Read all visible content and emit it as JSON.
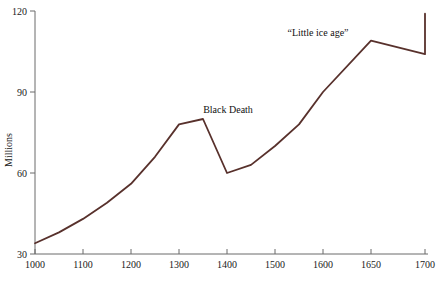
{
  "chart_data": {
    "type": "line",
    "title": "",
    "xlabel": "",
    "ylabel": "Millions",
    "xlim": [
      1000,
      1700
    ],
    "ylim": [
      30,
      120
    ],
    "grid": false,
    "legend": "none",
    "line_color": "#58312c",
    "axis_color": "#6b6b6b",
    "x_ticks": [
      1000,
      1100,
      1200,
      1300,
      1400,
      1500,
      1600,
      1650,
      1700
    ],
    "x_tick_labels": [
      "1000",
      "1100",
      "1200",
      "1300",
      "1400",
      "1500",
      "1600",
      "1650",
      "1700"
    ],
    "y_ticks": [
      30,
      60,
      90,
      120
    ],
    "y_tick_labels": [
      "30",
      "60",
      "90",
      "120"
    ],
    "x": [
      1000,
      1050,
      1100,
      1150,
      1200,
      1250,
      1300,
      1350,
      1400,
      1450,
      1500,
      1550,
      1600,
      1650,
      1700
    ],
    "values": [
      34,
      38,
      43,
      49,
      56,
      66,
      78,
      80,
      60,
      63,
      70,
      78,
      90,
      109,
      104
    ],
    "series": [
      {
        "name": "European population",
        "values": [
          34,
          38,
          43,
          49,
          56,
          66,
          78,
          80,
          60,
          63,
          70,
          78,
          90,
          109,
          104
        ]
      }
    ],
    "annotations": [
      {
        "text": "Black Death",
        "x": 1350,
        "y": 83
      },
      {
        "text": "“Little ice age”",
        "x": 1600,
        "y": 115
      }
    ],
    "end_point": {
      "x": 1700,
      "y": 119
    }
  },
  "axis": {
    "y_label": "Millions"
  }
}
